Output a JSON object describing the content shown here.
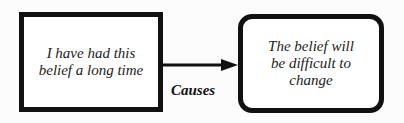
{
  "nodes": [
    {
      "id": "cause",
      "text_line1": "I have had this",
      "text_line2": "belief a long time"
    },
    {
      "id": "effect",
      "text_line1": "The belief will",
      "text_line2": "be difficult to",
      "text_line3": "change"
    }
  ],
  "edge": {
    "label": "Causes",
    "from": "cause",
    "to": "effect"
  }
}
